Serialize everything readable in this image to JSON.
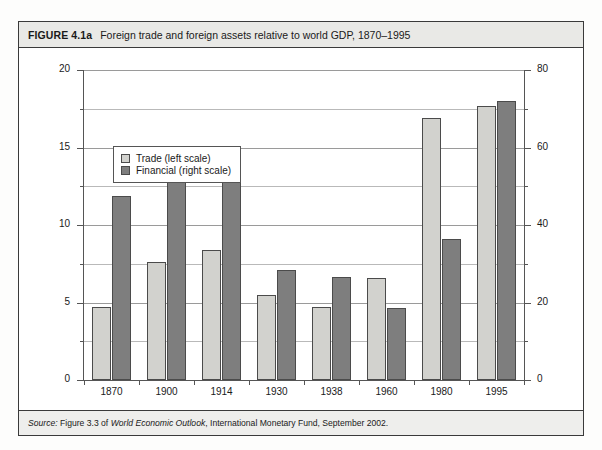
{
  "figure": {
    "number_label": "FIGURE 4.1a",
    "caption": "Foreign trade and foreign assets relative to world GDP, 1870–1995",
    "source_prefix": "Source:",
    "source_part1": " Figure 3.3 of ",
    "source_italic": "World Economic Outlook",
    "source_part2": ", International Monetary Fund, September 2002."
  },
  "legend": {
    "items": [
      {
        "label": "Trade (left scale)",
        "color": "#d2d2ce",
        "name": "trade"
      },
      {
        "label": "Financial (right scale)",
        "color": "#7e7e7e",
        "name": "financial"
      }
    ]
  },
  "chart_data": {
    "type": "bar",
    "title": "Foreign trade and foreign assets relative to world GDP, 1870–1995",
    "xlabel": "",
    "ylabel": "",
    "categories": [
      "1870",
      "1900",
      "1914",
      "1930",
      "1938",
      "1960",
      "1980",
      "1995"
    ],
    "series": [
      {
        "name": "Trade (left scale)",
        "axis": "left",
        "color": "#d2d2ce",
        "values": [
          4.7,
          7.6,
          8.4,
          5.5,
          4.7,
          6.6,
          16.9,
          17.7
        ]
      },
      {
        "name": "Financial (right scale)",
        "axis": "right",
        "color": "#7e7e7e",
        "values": [
          47.5,
          56.0,
          51.0,
          28.5,
          26.5,
          18.5,
          36.5,
          72.0
        ]
      }
    ],
    "left_axis": {
      "ticks": [
        0,
        5,
        10,
        15,
        20
      ],
      "minor_ticks": [
        2.5,
        7.5,
        12.5,
        17.5
      ],
      "ylim": [
        0,
        20
      ]
    },
    "right_axis": {
      "ticks": [
        0,
        20,
        40,
        60,
        80
      ],
      "minor_ticks": [
        10,
        30,
        50,
        70
      ],
      "ylim": [
        0,
        80
      ]
    },
    "grid": true,
    "legend_position": "upper left"
  }
}
